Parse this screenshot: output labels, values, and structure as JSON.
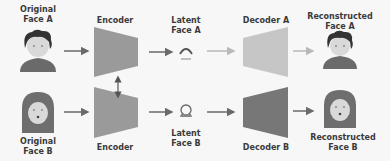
{
  "labels": {
    "original_a": [
      "Original",
      "Face A"
    ],
    "original_b": [
      "Original",
      "Face B"
    ],
    "encoder_top": "Encoder",
    "encoder_bottom": "Encoder",
    "latent_a": [
      "Latent",
      "Face A"
    ],
    "latent_b": [
      "Latent",
      "Face B"
    ],
    "decoder_a": "Decoder A",
    "decoder_b": "Decoder B",
    "recon_a": [
      "Reconstructed",
      "Face A"
    ],
    "recon_b": [
      "Reconstructed",
      "Face B"
    ]
  },
  "colors": {
    "background": "#f7f7f7",
    "encoder": "#9a9a9a",
    "decoder_a": "#c6c6c6",
    "decoder_b": "#777777",
    "arrow_dark": "#6a6a6a",
    "arrow_light": "#b8b8b8",
    "face_skin": "#d9d9d9",
    "hair_a": "#333333",
    "hijab_b": "#6e6e6e",
    "shirt": "#6a6a6a",
    "text": "#3a3a3a"
  },
  "icons": {
    "face_a": "person-curly-hair-icon",
    "face_b": "person-hijab-icon",
    "latent_a": "latent-arc-icon",
    "latent_b": "latent-circle-icon"
  }
}
